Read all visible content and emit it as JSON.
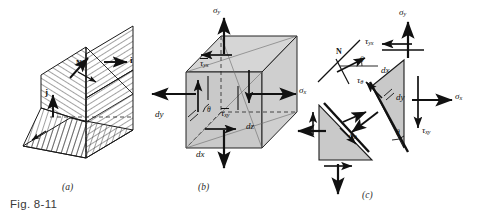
{
  "figure": {
    "caption": "Fig. 8-11",
    "panels": [
      {
        "id": "a",
        "label": "(a)",
        "title": "oblique-cut-wedge-with-unit-vectors"
      },
      {
        "id": "b",
        "label": "(b)",
        "title": "three-dimensional-stress-element"
      },
      {
        "id": "c",
        "label": "(c)",
        "title": "wedge-free-body-diagrams"
      }
    ]
  },
  "panel_a": {
    "labels": {
      "i_vector": "i",
      "j_vector": "j",
      "n_vector": "N"
    }
  },
  "panel_b": {
    "stresses": {
      "sigma_y": "σ",
      "sigma_y_sub": "y",
      "sigma_x": "σ",
      "sigma_x_sub": "x",
      "tau_yx": "τ",
      "tau_yx_sub": "yx",
      "tau_xy": "τ",
      "tau_xy_sub": "xy"
    },
    "dimensions": {
      "dx": "dx",
      "dy": "dy",
      "dz": "dz"
    },
    "angle": "θ"
  },
  "panel_c": {
    "inset": {
      "normal": "N",
      "angle": "θ"
    },
    "stresses": {
      "sigma_y": "σ",
      "sigma_y_sub": "y",
      "sigma_x": "σ",
      "sigma_x_sub": "x",
      "tau_yx": "τ",
      "tau_yx_sub": "yx",
      "tau_xy": "τ",
      "tau_xy_sub": "xy",
      "sigma_theta": "σ",
      "sigma_theta_sub": "θ",
      "tau_theta": "τ",
      "tau_theta_sub": "θ"
    },
    "dimensions": {
      "dx": "dx",
      "dy": "dy"
    },
    "angle": "θ"
  },
  "colors": {
    "face_fill": "#c9c9c9",
    "face_fill_light": "#d6d6d6",
    "stroke": "#1a1a1a",
    "caption_text": "#3a3a3a",
    "background": "#ffffff"
  }
}
